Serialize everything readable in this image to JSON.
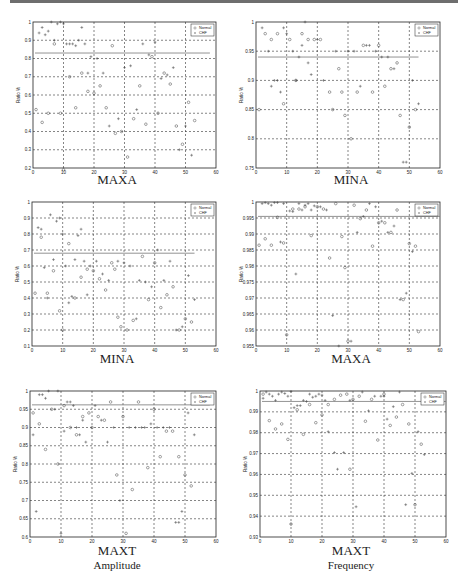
{
  "page": {
    "top_rule_color": "#6e6e6e"
  },
  "legend": {
    "series": [
      "Normal",
      "CHF"
    ]
  },
  "chart_data": [
    {
      "type": "scatter",
      "title": "MAXA",
      "subtitle": "",
      "xlabel": "",
      "ylabel": "Ratio %",
      "xlim": [
        0,
        60
      ],
      "ylim": [
        0.2,
        1
      ],
      "xticks": [
        0,
        10,
        20,
        30,
        40,
        50,
        60
      ],
      "yticks": [
        0.2,
        0.3,
        0.4,
        0.5,
        0.6,
        0.7,
        0.8,
        0.9,
        1
      ],
      "ytick_labels": [
        "0.2",
        "0.3",
        "0.4",
        "0.5",
        "0.6",
        "0.7",
        "0.8",
        "0.9",
        "1"
      ],
      "grid": true,
      "legend_position": "upper right",
      "threshold": 0.83,
      "threshold_xmax": 58,
      "series": [
        {
          "name": "Normal",
          "marker": "o",
          "x": [
            1,
            3,
            5,
            7,
            9,
            10,
            12,
            14,
            16,
            18,
            20,
            22,
            24,
            26,
            27,
            29,
            31,
            33,
            35,
            37,
            39,
            41,
            43,
            45,
            47,
            49,
            51,
            53
          ],
          "y": [
            0.52,
            0.45,
            0.5,
            0.88,
            0.5,
            0.19,
            0.7,
            0.53,
            0.72,
            0.62,
            0.61,
            0.65,
            0.53,
            0.87,
            0.39,
            0.4,
            0.26,
            0.47,
            0.65,
            0.44,
            0.81,
            0.5,
            0.72,
            0.66,
            0.43,
            0.33,
            0.56,
            0.46
          ]
        },
        {
          "name": "CHF",
          "marker": "+",
          "x": [
            2,
            3,
            4,
            5,
            6,
            7,
            8,
            9,
            10,
            11,
            12,
            13,
            14,
            15,
            16,
            17,
            18,
            19,
            21,
            23,
            25,
            28,
            30,
            32,
            34,
            36,
            38,
            40,
            42,
            44,
            46,
            48,
            50,
            52
          ],
          "y": [
            0.94,
            0.97,
            0.93,
            0.95,
            1.0,
            0.9,
            0.99,
            1.0,
            0.99,
            0.88,
            0.88,
            0.88,
            0.87,
            0.9,
            0.97,
            0.88,
            0.72,
            0.81,
            0.8,
            0.72,
            0.43,
            0.47,
            0.75,
            0.76,
            0.52,
            0.88,
            0.82,
            0.89,
            0.69,
            0.71,
            0.75,
            0.3,
            0.43,
            0.27
          ]
        }
      ]
    },
    {
      "type": "scatter",
      "title": "MINA",
      "subtitle": "",
      "xlabel": "",
      "ylabel": "Ratio %",
      "xlim": [
        0,
        60
      ],
      "ylim": [
        0.75,
        1
      ],
      "xticks": [
        0,
        10,
        20,
        30,
        40,
        50,
        60
      ],
      "yticks": [
        0.75,
        0.8,
        0.85,
        0.9,
        0.95,
        1
      ],
      "ytick_labels": [
        "0.75",
        "0.8",
        "0.85",
        "0.9",
        "0.95",
        "1"
      ],
      "grid": true,
      "legend_position": "upper right",
      "threshold": 0.94,
      "threshold_xmax": 53,
      "series": [
        {
          "name": "Normal",
          "marker": "o",
          "x": [
            1,
            3,
            5,
            7,
            9,
            11,
            13,
            15,
            17,
            19,
            21,
            24,
            25,
            27,
            28,
            29,
            31,
            33,
            35,
            38,
            40,
            42,
            44,
            46,
            47,
            50,
            52
          ],
          "y": [
            0.85,
            0.98,
            0.97,
            0.98,
            0.86,
            0.97,
            0.9,
            0.98,
            0.97,
            0.97,
            0.97,
            0.88,
            0.85,
            0.92,
            0.88,
            0.84,
            0.8,
            0.88,
            0.96,
            0.88,
            0.96,
            0.89,
            0.92,
            0.93,
            0.84,
            0.82,
            0.85
          ]
        },
        {
          "name": "CHF",
          "marker": "+",
          "x": [
            2,
            4,
            5,
            6,
            7,
            8,
            9,
            10,
            12,
            13,
            14,
            15,
            16,
            17,
            18,
            20,
            22,
            26,
            30,
            32,
            34,
            36,
            37,
            39,
            41,
            43,
            45,
            48,
            49,
            51,
            53
          ],
          "y": [
            0.99,
            0.95,
            0.89,
            0.9,
            0.9,
            0.88,
            0.99,
            0.98,
            0.95,
            0.9,
            0.94,
            0.96,
            1.0,
            0.93,
            0.91,
            0.97,
            0.9,
            0.95,
            0.95,
            0.95,
            0.89,
            0.96,
            0.96,
            0.95,
            0.94,
            0.94,
            0.92,
            0.76,
            0.76,
            0.9,
            0.86
          ]
        }
      ]
    },
    {
      "type": "scatter",
      "title": "MINA",
      "subtitle": "",
      "xlabel": "",
      "ylabel": "Ratio %",
      "xlim": [
        0,
        60
      ],
      "ylim": [
        0.1,
        1
      ],
      "xticks": [
        0,
        10,
        20,
        30,
        40,
        50,
        60
      ],
      "yticks": [
        0.1,
        0.2,
        0.3,
        0.4,
        0.5,
        0.6,
        0.7,
        0.8,
        0.9,
        1
      ],
      "ytick_labels": [
        "0.1",
        "0.2",
        "0.3",
        "0.4",
        "0.5",
        "0.6",
        "0.7",
        "0.8",
        "0.9",
        "1"
      ],
      "grid": true,
      "legend_position": "upper right",
      "threshold": 0.68,
      "threshold_xmax": 53,
      "series": [
        {
          "name": "Normal",
          "marker": "o",
          "x": [
            1,
            3,
            5,
            7,
            9,
            10,
            12,
            14,
            16,
            18,
            20,
            22,
            24,
            26,
            27,
            28,
            29,
            31,
            33,
            36,
            38,
            40,
            42,
            44,
            46,
            48,
            50,
            52
          ],
          "y": [
            0.43,
            0.78,
            0.43,
            0.57,
            0.32,
            0.2,
            0.74,
            0.4,
            0.53,
            0.58,
            0.57,
            0.52,
            0.45,
            0.62,
            0.58,
            0.28,
            0.22,
            0.2,
            0.26,
            0.66,
            0.39,
            0.62,
            0.34,
            0.42,
            0.47,
            0.2,
            0.27,
            0.25
          ]
        },
        {
          "name": "CHF",
          "marker": "+",
          "x": [
            2,
            3,
            4,
            5,
            6,
            7,
            8,
            9,
            10,
            11,
            12,
            13,
            14,
            15,
            16,
            17,
            18,
            19,
            21,
            23,
            25,
            28,
            30,
            32,
            34,
            35,
            37,
            39,
            41,
            43,
            45,
            47,
            49,
            51,
            53
          ],
          "y": [
            0.84,
            0.83,
            0.59,
            0.4,
            0.92,
            0.64,
            0.88,
            0.9,
            0.8,
            0.6,
            0.37,
            0.41,
            0.64,
            0.79,
            0.83,
            0.63,
            0.42,
            0.6,
            0.63,
            0.55,
            0.51,
            0.63,
            0.62,
            0.6,
            0.27,
            0.51,
            0.5,
            0.47,
            0.7,
            0.51,
            0.63,
            0.2,
            0.22,
            0.54,
            0.39
          ]
        }
      ]
    },
    {
      "type": "scatter",
      "title": "MAXA",
      "subtitle": "",
      "xlabel": "",
      "ylabel": "Ratio %",
      "xlim": [
        0,
        60
      ],
      "ylim": [
        0.955,
        1
      ],
      "xticks": [
        0,
        10,
        20,
        30,
        40,
        50,
        60
      ],
      "yticks": [
        0.955,
        0.96,
        0.965,
        0.97,
        0.975,
        0.98,
        0.985,
        0.99,
        0.995,
        1
      ],
      "ytick_labels": [
        "0.955",
        "0.96",
        "0.965",
        "0.97",
        "0.975",
        "0.98",
        "0.985",
        "0.99",
        "0.995",
        "1"
      ],
      "grid": true,
      "legend_position": "upper right",
      "threshold": 0.9955,
      "threshold_xmax": 60,
      "series": [
        {
          "name": "Normal",
          "marker": "o",
          "x": [
            1,
            3,
            5,
            7,
            9,
            10,
            12,
            14,
            16,
            18,
            20,
            22,
            24,
            26,
            28,
            29,
            30,
            32,
            34,
            36,
            38,
            40,
            42,
            44,
            46,
            48,
            50,
            52,
            53
          ],
          "y": [
            0.9865,
            0.9885,
            0.9865,
            0.9952,
            0.9872,
            0.9585,
            0.9978,
            0.9978,
            0.9985,
            0.9895,
            0.9985,
            0.9978,
            0.9825,
            0.9995,
            0.9892,
            0.9795,
            0.9565,
            0.999,
            0.9948,
            0.9975,
            0.9862,
            0.9935,
            0.9935,
            0.9905,
            0.9975,
            0.9695,
            0.987,
            0.9862,
            0.9595
          ]
        },
        {
          "name": "CHF",
          "marker": "+",
          "x": [
            2,
            3,
            4,
            5,
            6,
            7,
            8,
            9,
            11,
            12,
            13,
            14,
            15,
            16,
            17,
            18,
            19,
            21,
            23,
            25,
            27,
            31,
            33,
            35,
            37,
            39,
            41,
            43,
            45,
            47,
            49,
            51
          ],
          "y": [
            0.9995,
            0.9998,
            0.9995,
            0.999,
            0.9998,
            0.9998,
            0.9875,
            0.9995,
            0.9972,
            0.997,
            0.9775,
            0.9995,
            0.9975,
            0.999,
            0.9995,
            0.9975,
            0.9988,
            0.9985,
            0.9975,
            0.9645,
            0.955,
            0.9565,
            0.9905,
            0.9955,
            0.9995,
            0.9985,
            0.994,
            0.9905,
            0.9925,
            0.9695,
            0.9715,
            0.9845
          ]
        }
      ]
    },
    {
      "type": "scatter",
      "title": "MAXT",
      "subtitle": "Amplitude",
      "xlabel": "",
      "ylabel": "Ratio %",
      "xlim": [
        0,
        60
      ],
      "ylim": [
        0.6,
        1
      ],
      "xticks": [
        0,
        10,
        20,
        30,
        40,
        50,
        60
      ],
      "yticks": [
        0.6,
        0.65,
        0.7,
        0.75,
        0.8,
        0.85,
        0.9,
        0.95,
        1
      ],
      "ytick_labels": [
        "0.6",
        "0.65",
        "0.7",
        "0.75",
        "0.8",
        "0.85",
        "0.9",
        "0.95",
        "1"
      ],
      "grid": true,
      "legend_position": "upper right",
      "threshold": 0.962,
      "threshold_xmax": 58,
      "series": [
        {
          "name": "Normal",
          "marker": "o",
          "x": [
            1,
            3,
            5,
            7,
            9,
            11,
            13,
            15,
            17,
            19,
            20,
            22,
            24,
            26,
            28,
            30,
            31,
            33,
            35,
            38,
            40,
            42,
            44,
            46,
            48,
            50,
            52
          ],
          "y": [
            0.94,
            0.91,
            0.84,
            0.95,
            0.8,
            0.96,
            0.9,
            0.88,
            0.93,
            0.94,
            0.9,
            0.93,
            0.92,
            0.97,
            0.77,
            0.93,
            0.61,
            0.73,
            0.97,
            0.79,
            0.95,
            0.82,
            0.89,
            0.89,
            0.82,
            0.77,
            0.74
          ]
        },
        {
          "name": "CHF",
          "marker": "+",
          "x": [
            1,
            2,
            3,
            4,
            5,
            6,
            8,
            9,
            10,
            11,
            12,
            13,
            14,
            15,
            16,
            17,
            18,
            21,
            23,
            25,
            27,
            29,
            32,
            34,
            36,
            37,
            39,
            41,
            43,
            45,
            47,
            48,
            49,
            51,
            53
          ],
          "y": [
            0.88,
            0.67,
            0.99,
            0.99,
            0.98,
            1.0,
            0.95,
            1.0,
            0.61,
            0.89,
            0.97,
            0.97,
            0.96,
            0.9,
            0.88,
            0.92,
            0.86,
            0.96,
            0.92,
            0.86,
            0.9,
            0.7,
            0.9,
            0.9,
            0.9,
            0.9,
            0.91,
            0.9,
            0.9,
            0.9,
            0.64,
            0.64,
            0.67,
            0.94,
            0.88
          ]
        }
      ]
    },
    {
      "type": "scatter",
      "title": "MAXT",
      "subtitle": "Frequency",
      "xlabel": "",
      "ylabel": "Ratio %",
      "xlim": [
        0,
        60
      ],
      "ylim": [
        0.93,
        1
      ],
      "xticks": [
        0,
        10,
        20,
        30,
        40,
        50,
        60
      ],
      "yticks": [
        0.93,
        0.94,
        0.95,
        0.96,
        0.97,
        0.98,
        0.99,
        1
      ],
      "ytick_labels": [
        "0.93",
        "0.94",
        "0.95",
        "0.96",
        "0.97",
        "0.98",
        "0.99",
        "1"
      ],
      "grid": true,
      "legend_position": "upper right",
      "threshold": 0.995,
      "threshold_xmax": 60,
      "series": [
        {
          "name": "Normal",
          "marker": "o",
          "x": [
            1,
            3,
            5,
            7,
            9,
            10,
            12,
            14,
            16,
            18,
            20,
            22,
            24,
            26,
            28,
            29,
            30,
            32,
            34,
            36,
            38,
            40,
            42,
            44,
            46,
            48,
            50,
            52
          ],
          "y": [
            0.9985,
            0.9858,
            0.9818,
            0.9842,
            0.9768,
            0.9362,
            0.991,
            0.9792,
            0.9935,
            0.9848,
            0.9885,
            0.9935,
            0.996,
            0.998,
            0.9985,
            0.9625,
            0.996,
            0.9975,
            0.9855,
            0.996,
            0.9765,
            0.9985,
            0.9835,
            0.9875,
            0.9935,
            0.9842,
            0.9455,
            0.9745
          ]
        },
        {
          "name": "CHF",
          "marker": "+",
          "x": [
            1,
            2,
            3,
            4,
            5,
            6,
            7,
            8,
            9,
            10,
            11,
            12,
            13,
            14,
            15,
            16,
            17,
            18,
            19,
            20,
            21,
            22,
            24,
            25,
            27,
            29,
            31,
            33,
            35,
            37,
            39,
            40,
            41,
            43,
            45,
            47,
            49,
            51,
            53
          ],
          "y": [
            0.9965,
            0.9995,
            0.9985,
            0.9975,
            0.9955,
            0.9985,
            0.9995,
            0.9988,
            0.9975,
            0.9998,
            0.992,
            0.993,
            0.993,
            0.9955,
            0.995,
            0.9985,
            0.997,
            0.9975,
            0.9985,
            0.998,
            0.9955,
            0.9805,
            0.9705,
            0.9625,
            0.9705,
            0.9955,
            0.9445,
            0.9995,
            0.9905,
            0.9975,
            0.9975,
            0.9975,
            0.9865,
            0.9925,
            0.9995,
            0.9455,
            0.9605,
            0.9805,
            0.9695
          ]
        }
      ]
    }
  ],
  "panels": [
    {
      "title": "MAXA",
      "subtitle": ""
    },
    {
      "title": "MINA",
      "subtitle": ""
    },
    {
      "title": "MINA",
      "subtitle": ""
    },
    {
      "title": "MAXA",
      "subtitle": ""
    },
    {
      "title": "MAXT",
      "subtitle": "Amplitude"
    },
    {
      "title": "MAXT",
      "subtitle": "Frequency"
    }
  ]
}
